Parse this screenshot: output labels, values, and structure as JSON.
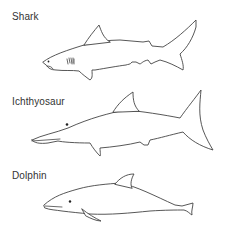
{
  "figure": {
    "panels": [
      {
        "id": "shark",
        "label": "Shark"
      },
      {
        "id": "ichthyosaur",
        "label": "Ichthyosaur"
      },
      {
        "id": "dolphin",
        "label": "Dolphin"
      }
    ],
    "colors": {
      "background": "#ffffff",
      "stroke": "#444444",
      "text": "#333333"
    }
  }
}
